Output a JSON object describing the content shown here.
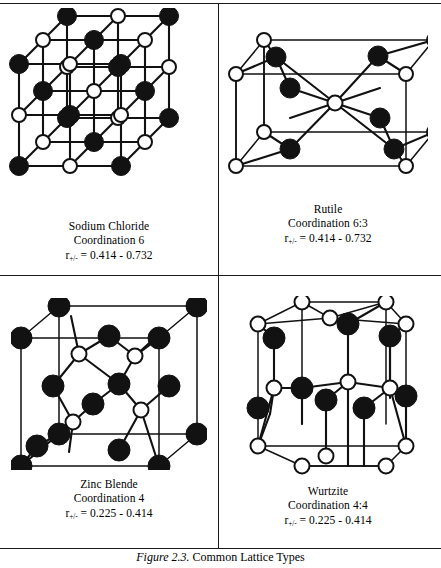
{
  "figure": {
    "number": "Figure 2.3.",
    "title": "Common Lattice Types"
  },
  "cells": [
    {
      "id": "sodium-chloride",
      "name": "Sodium Chloride",
      "coordination": "Coordination 6",
      "ratio_symbol": "r",
      "ratio_subscript": "+/-",
      "ratio_value": "= 0.414 - 0.732",
      "ratio_full": "r+/- = 0.414 - 0.732",
      "structure": "rock-salt-cubic-3x3x3"
    },
    {
      "id": "rutile",
      "name": "Rutile",
      "coordination": "Coordination 6:3",
      "ratio_symbol": "r",
      "ratio_subscript": "+/-",
      "ratio_value": "= 0.414 - 0.732",
      "ratio_full": "r+/- = 0.414 - 0.732",
      "structure": "rutile-tetragonal"
    },
    {
      "id": "zinc-blende",
      "name": "Zinc Blende",
      "coordination": "Coordination 4",
      "ratio_symbol": "r",
      "ratio_subscript": "+/-",
      "ratio_value": "= 0.225 - 0.414",
      "ratio_full": "r+/- = 0.225 - 0.414",
      "structure": "zinc-blende-cubic"
    },
    {
      "id": "wurtzite",
      "name": "Wurtzite",
      "coordination": "Coordination 4:4",
      "ratio_symbol": "r",
      "ratio_subscript": "+/-",
      "ratio_value": "= 0.225 - 0.414",
      "ratio_full": "r+/- = 0.225 - 0.414",
      "structure": "wurtzite-hexagonal"
    }
  ],
  "colors": {
    "line": "#1a1a1a",
    "bond": "#111111",
    "atom_filled": "#121212",
    "atom_open_fill": "#ffffff",
    "background": "#ffffff"
  },
  "legend": {
    "filled_atom": "anion-or-cation-filled",
    "open_atom": "anion-or-cation-open"
  }
}
